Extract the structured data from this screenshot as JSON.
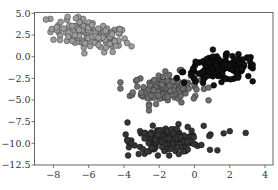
{
  "chart_data": {
    "type": "scatter",
    "title": "",
    "xlabel": "",
    "ylabel": "",
    "xlim": [
      -9.07,
      4.45
    ],
    "ylim": [
      -12.5,
      5.1
    ],
    "grid": false,
    "legend": null,
    "x_ticks": [
      -8,
      -6,
      -4,
      -2,
      0,
      2,
      4
    ],
    "x_tick_labels": [
      "−8",
      "−6",
      "−4",
      "−2",
      "0",
      "2",
      "4"
    ],
    "y_ticks": [
      5.0,
      2.5,
      0.0,
      -2.5,
      -5.0,
      -7.5,
      -10.0,
      -12.5
    ],
    "y_tick_labels": [
      "5.0",
      "2.5",
      "0.0",
      "−2.5",
      "−5.0",
      "−7.5",
      "−10.0",
      "−12.5"
    ],
    "series": [
      {
        "name": "cluster_top_left",
        "color": "#9c9c9c",
        "edge_color": "#3a3a3a",
        "center": [
          -5.9,
          2.5
        ],
        "spread": [
          1.1,
          0.85
        ],
        "tilt": -0.35,
        "count": 130,
        "extent": {
          "x": [
            -8.6,
            -3.5
          ],
          "y": [
            0.3,
            4.6
          ]
        }
      },
      {
        "name": "cluster_middle",
        "color": "#6f6f6f",
        "edge_color": "#2a2a2a",
        "center": [
          -1.6,
          -3.6
        ],
        "spread": [
          0.95,
          0.85
        ],
        "tilt": 0.1,
        "count": 150,
        "extent": {
          "x": [
            -4.2,
            0.8
          ],
          "y": [
            -6.2,
            -0.9
          ]
        }
      },
      {
        "name": "cluster_right",
        "color": "#111111",
        "edge_color": "#000000",
        "center": [
          1.5,
          -1.4
        ],
        "spread": [
          1.05,
          0.7
        ],
        "tilt": 0.15,
        "count": 160,
        "extent": {
          "x": [
            -1.0,
            3.3
          ],
          "y": [
            -4.6,
            1.5
          ]
        }
      },
      {
        "name": "cluster_bottom",
        "color": "#353535",
        "edge_color": "#111111",
        "center": [
          -1.5,
          -9.6
        ],
        "spread": [
          1.0,
          0.75
        ],
        "tilt": 0.05,
        "count": 160,
        "extent": {
          "x": [
            -3.9,
            2.9
          ],
          "y": [
            -11.4,
            -7.0
          ]
        },
        "outliers": [
          [
            2.0,
            -8.6
          ],
          [
            2.9,
            -8.8
          ],
          [
            1.3,
            -10.8
          ],
          [
            -3.8,
            -7.6
          ],
          [
            -3.8,
            -9.6
          ]
        ]
      }
    ],
    "marker_size": 5.2
  }
}
